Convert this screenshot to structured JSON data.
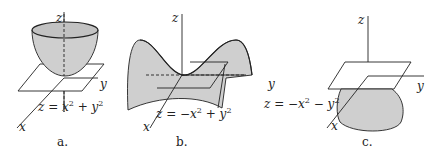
{
  "figure": {
    "panels": [
      {
        "id": "a",
        "caption": "a.",
        "axes": {
          "z": "z",
          "y": "y",
          "x": "x"
        },
        "equation": {
          "lhs": "z = x",
          "exp1": "2",
          "mid": " + y",
          "exp2": "2"
        },
        "surface": "elliptic paraboloid (opening up)"
      },
      {
        "id": "b",
        "caption": "b.",
        "axes": {
          "z": "z",
          "y": "y",
          "x": "x"
        },
        "equation": {
          "lhs": "z = −x",
          "exp1": "2",
          "mid": " + y",
          "exp2": "2"
        },
        "surface": "hyperbolic paraboloid (saddle)"
      },
      {
        "id": "c",
        "caption": "c.",
        "axes": {
          "z": "z",
          "y": "y",
          "x": "x"
        },
        "equation": {
          "lhs": "z = −x",
          "exp1": "2",
          "mid": " − y",
          "exp2": "2"
        },
        "surface": "elliptic paraboloid (opening down)"
      }
    ],
    "colors": {
      "fill": "#cfcfcf",
      "stroke": "#222222",
      "background": "#ffffff"
    }
  }
}
